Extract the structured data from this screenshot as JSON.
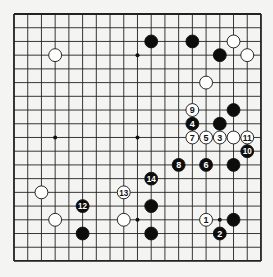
{
  "board": {
    "size": 19,
    "origin_x": 14,
    "origin_y": 14,
    "spacing": 13.72,
    "background": "#f4f4f2",
    "line_color": "#222222",
    "star_points": [
      [
        3,
        3
      ],
      [
        9,
        3
      ],
      [
        15,
        3
      ],
      [
        3,
        9
      ],
      [
        9,
        9
      ],
      [
        15,
        9
      ],
      [
        3,
        15
      ],
      [
        9,
        15
      ],
      [
        15,
        15
      ]
    ]
  },
  "stones": [
    {
      "color": "black",
      "col": 10,
      "row": 2
    },
    {
      "color": "black",
      "col": 13,
      "row": 2
    },
    {
      "color": "white",
      "col": 16,
      "row": 2
    },
    {
      "color": "white",
      "col": 3,
      "row": 3
    },
    {
      "color": "black",
      "col": 15,
      "row": 3
    },
    {
      "color": "white",
      "col": 17,
      "row": 3
    },
    {
      "color": "white",
      "col": 14,
      "row": 5
    },
    {
      "color": "black",
      "col": 16,
      "row": 7
    },
    {
      "color": "black",
      "col": 15,
      "row": 8
    },
    {
      "color": "white",
      "col": 16,
      "row": 9
    },
    {
      "color": "black",
      "col": 16,
      "row": 11
    },
    {
      "color": "white",
      "col": 2,
      "row": 13
    },
    {
      "color": "black",
      "col": 10,
      "row": 14
    },
    {
      "color": "white",
      "col": 3,
      "row": 15
    },
    {
      "color": "white",
      "col": 8,
      "row": 15
    },
    {
      "color": "black",
      "col": 16,
      "row": 15
    },
    {
      "color": "black",
      "col": 5,
      "row": 16
    },
    {
      "color": "black",
      "col": 10,
      "row": 16
    }
  ],
  "moves": [
    {
      "number": "1",
      "color": "white",
      "col": 14,
      "row": 15
    },
    {
      "number": "2",
      "color": "black",
      "col": 15,
      "row": 16
    },
    {
      "number": "3",
      "color": "white",
      "col": 15,
      "row": 9
    },
    {
      "number": "4",
      "color": "black",
      "col": 13,
      "row": 8
    },
    {
      "number": "5",
      "color": "white",
      "col": 14,
      "row": 9
    },
    {
      "number": "6",
      "color": "black",
      "col": 14,
      "row": 11
    },
    {
      "number": "7",
      "color": "white",
      "col": 13,
      "row": 9
    },
    {
      "number": "8",
      "color": "black",
      "col": 12,
      "row": 11
    },
    {
      "number": "9",
      "color": "white",
      "col": 13,
      "row": 7
    },
    {
      "number": "10",
      "color": "black",
      "col": 17,
      "row": 10
    },
    {
      "number": "11",
      "color": "white",
      "col": 17,
      "row": 9
    },
    {
      "number": "12",
      "color": "black",
      "col": 5,
      "row": 14
    },
    {
      "number": "13",
      "color": "white",
      "col": 8,
      "row": 13
    },
    {
      "number": "14",
      "color": "black",
      "col": 10,
      "row": 12
    }
  ]
}
